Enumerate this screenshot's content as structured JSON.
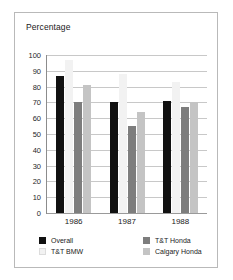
{
  "frame": {
    "border_color": "#b9b9b9",
    "background": "#ffffff"
  },
  "chart_data": {
    "type": "bar",
    "title": "Percentage",
    "xlabel": "",
    "ylabel": "",
    "ylim": [
      0,
      100
    ],
    "yticks": [
      100,
      90,
      80,
      70,
      60,
      50,
      40,
      30,
      20,
      10,
      0
    ],
    "grid": true,
    "legend_position": "bottom",
    "categories": [
      "1986",
      "1987",
      "1988"
    ],
    "series": [
      {
        "name": "Overall",
        "color": "#111111",
        "values": [
          87,
          70,
          71
        ]
      },
      {
        "name": "T&T BMW",
        "color": "#f2f2f2",
        "values": [
          97,
          88,
          83
        ]
      },
      {
        "name": "T&T Honda",
        "color": "#7d7d7d",
        "values": [
          70,
          55,
          67
        ]
      },
      {
        "name": "Calgary Honda",
        "color": "#c4c4c4",
        "values": [
          81,
          64,
          70
        ]
      }
    ]
  },
  "legend": {
    "items": [
      {
        "label": "Overall",
        "color": "#111111"
      },
      {
        "label": "T&T Honda",
        "color": "#7d7d7d"
      },
      {
        "label": "T&T BMW",
        "color": "#f2f2f2"
      },
      {
        "label": "Calgary Honda",
        "color": "#c4c4c4"
      }
    ]
  }
}
